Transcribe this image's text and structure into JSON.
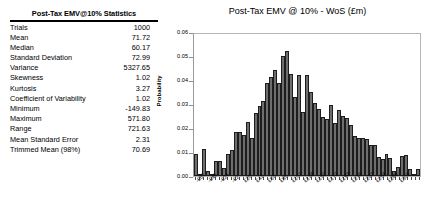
{
  "stats_panel": {
    "title": "Post-Tax EMV@10% Statistics",
    "rows": [
      {
        "label": "Trials",
        "value": "1000"
      },
      {
        "label": "Mean",
        "value": "71.72"
      },
      {
        "label": "Median",
        "value": "60.17"
      },
      {
        "label": "Standard Deviation",
        "value": "72.99"
      },
      {
        "label": "Variance",
        "value": "5327.65"
      },
      {
        "label": "Skewness",
        "value": "1.02"
      },
      {
        "label": "Kurtosis",
        "value": "3.27"
      },
      {
        "label": "Coefficient of Variability",
        "value": "1.02"
      },
      {
        "label": "Minimum",
        "value": "-149.83"
      },
      {
        "label": "Maximum",
        "value": "571.80"
      },
      {
        "label": "Range",
        "value": "721.63"
      },
      {
        "label": "Mean Standard Error",
        "value": "2.31"
      },
      {
        "label": "Trimmed Mean (98%)",
        "value": "70.69"
      }
    ]
  },
  "chart_data": {
    "type": "bar",
    "title": "Post-Tax EMV @ 10% - WoS (£m)",
    "xlabel": "",
    "ylabel": "Probability",
    "ylim": [
      0,
      0.06
    ],
    "ytick_labels": [
      "0.06",
      "0.05",
      "0.04",
      "0.03",
      "0.02",
      "0.01",
      "0.00"
    ],
    "ytick_values": [
      0.06,
      0.05,
      0.04,
      0.03,
      0.02,
      0.01,
      0.0
    ],
    "grid": false,
    "legend": "none",
    "bar_color": "#6e6e6e",
    "bar_edge_color": "#1d1d1d",
    "xtick_labels": [
      "-£67",
      "-£46",
      "-£24",
      "-£2",
      "£20",
      "£42",
      "£63",
      "£85",
      "£107",
      "£128",
      "£150",
      "£172",
      "£193",
      "£215",
      "£237",
      "£258",
      "£280",
      "£302"
    ],
    "xtick_bin_indices": [
      0,
      3,
      6,
      9,
      12,
      15,
      18,
      21,
      24,
      27,
      30,
      33,
      36,
      39,
      42,
      45,
      48,
      51
    ],
    "values": [
      0.0095,
      0.0,
      0.0115,
      0.0022,
      0.0,
      0.0065,
      0.0065,
      0.0035,
      0.0093,
      0.0112,
      0.0188,
      0.0185,
      0.0175,
      0.023,
      0.016,
      0.0265,
      0.0295,
      0.0315,
      0.0395,
      0.042,
      0.0448,
      0.0395,
      0.0505,
      0.053,
      0.043,
      0.0335,
      0.0425,
      0.027,
      0.0425,
      0.0355,
      0.031,
      0.0285,
      0.025,
      0.024,
      0.03,
      0.0225,
      0.028,
      0.0255,
      0.0245,
      0.0215,
      0.017,
      0.016,
      0.016,
      0.0155,
      0.013,
      0.013,
      0.008,
      0.007,
      0.0095,
      0.0075,
      0.002,
      0.004,
      0.0085,
      0.009,
      0.003,
      0.0,
      0.003
    ]
  }
}
